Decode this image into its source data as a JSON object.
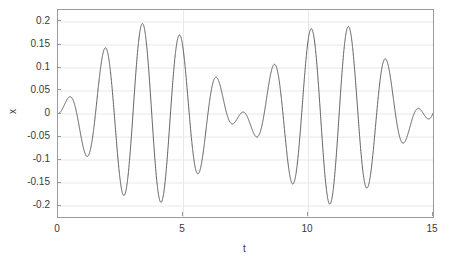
{
  "chart_data": {
    "type": "line",
    "title": "",
    "subtitle": "",
    "xlabel": "t",
    "ylabel": "x",
    "xlim": [
      0,
      15
    ],
    "ylim": [
      -0.225,
      0.225
    ],
    "xticks": [
      0,
      5,
      10,
      15
    ],
    "xtick_labels": [
      "0",
      "5",
      "10",
      "15"
    ],
    "yticks": [
      0.2,
      0.15,
      0.1,
      0.05,
      0,
      -0.05,
      -0.1,
      -0.15,
      -0.2
    ],
    "ytick_labels": [
      "0.2",
      "0.15",
      "0.1",
      "0.05",
      "0",
      "-0.05",
      "-0.1",
      "-0.15",
      "-0.2"
    ],
    "grid": true,
    "grid_color": "#e8e8e8",
    "axes_color": "#9a9a9a",
    "background_color": "#ffffff",
    "legend": null,
    "legend_position": "none",
    "series": [
      {
        "name": "x(t)",
        "color": "#4d4d4d",
        "line_width": 0.9,
        "description": "Beating oscillation: superposition of two close frequencies, zero initial value and slope, amplitude envelope alternating between about 0.14 and 0.20",
        "model": {
          "form": "A*(cos(w1*t) - cos(w2*t))",
          "amplitude": 0.0985,
          "omega1": 3.76,
          "omega2": 4.62
        },
        "x": [
          0.0,
          0.1,
          0.2,
          0.3,
          0.4,
          0.5,
          0.6,
          0.7,
          0.8,
          0.9,
          1.0,
          1.1,
          1.2,
          1.3,
          1.4,
          1.5,
          1.6,
          1.7,
          1.8,
          1.9,
          2.0,
          2.1,
          2.2,
          2.3,
          2.4,
          2.5,
          2.6,
          2.7,
          2.8,
          2.9,
          3.0,
          3.1,
          3.2,
          3.3,
          3.4,
          3.5,
          3.6,
          3.7,
          3.8,
          3.9,
          4.0,
          4.1,
          4.2,
          4.3,
          4.4,
          4.5,
          4.6,
          4.7,
          4.8,
          4.9,
          5.0,
          5.1,
          5.2,
          5.3,
          5.4,
          5.5,
          5.6,
          5.7,
          5.8,
          5.9,
          6.0,
          6.1,
          6.2,
          6.3,
          6.4,
          6.5,
          6.6,
          6.7,
          6.8,
          6.9,
          7.0,
          7.1,
          7.2,
          7.3,
          7.4,
          7.5,
          7.6,
          7.7,
          7.8,
          7.9,
          8.0,
          8.1,
          8.2,
          8.3,
          8.4,
          8.5,
          8.6,
          8.7,
          8.8,
          8.9,
          9.0,
          9.1,
          9.2,
          9.3,
          9.4,
          9.5,
          9.6,
          9.7,
          9.8,
          9.9,
          10.0,
          10.1,
          10.2,
          10.3,
          10.4,
          10.5,
          10.6,
          10.7,
          10.8,
          10.9,
          11.0,
          11.1,
          11.2,
          11.3,
          11.4,
          11.5,
          11.6,
          11.7,
          11.8,
          11.9,
          12.0,
          12.1,
          12.2,
          12.3,
          12.4,
          12.5,
          12.6,
          12.7,
          12.8,
          12.9,
          13.0,
          13.1,
          13.2,
          13.3,
          13.4,
          13.5,
          13.6,
          13.7,
          13.8,
          13.9,
          14.0,
          14.1,
          14.2,
          14.3,
          14.4,
          14.5,
          14.6,
          14.7,
          14.8,
          14.9,
          15.0
        ],
        "y_annotations": {
          "peaks": [
            {
              "t": 0.8,
              "x": 0.068
            },
            {
              "t": 2.3,
              "x": 0.163
            },
            {
              "t": 3.85,
              "x": 0.139
            },
            {
              "t": 5.45,
              "x": 0.195
            },
            {
              "t": 7.0,
              "x": 0.145
            },
            {
              "t": 8.6,
              "x": 0.197
            },
            {
              "t": 10.15,
              "x": 0.146
            },
            {
              "t": 11.7,
              "x": 0.196
            },
            {
              "t": 13.3,
              "x": 0.145
            },
            {
              "t": 15.0,
              "x": 0.196
            }
          ],
          "troughs": [
            {
              "t": 1.55,
              "x": -0.129
            },
            {
              "t": 3.05,
              "x": -0.155
            },
            {
              "t": 4.65,
              "x": -0.177
            },
            {
              "t": 6.15,
              "x": -0.169
            },
            {
              "t": 7.8,
              "x": -0.183
            },
            {
              "t": 9.35,
              "x": -0.171
            },
            {
              "t": 10.95,
              "x": -0.183
            },
            {
              "t": 12.5,
              "x": -0.17
            },
            {
              "t": 14.1,
              "x": -0.182
            }
          ],
          "start": {
            "t": 0,
            "x": 0
          }
        }
      }
    ]
  }
}
